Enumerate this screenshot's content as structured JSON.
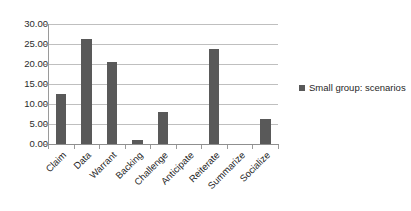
{
  "chart_data": {
    "type": "bar",
    "title": "",
    "xlabel": "",
    "ylabel": "",
    "categories": [
      "Claim",
      "Data",
      "Warrant",
      "Backing",
      "Challenge",
      "Anticipate",
      "Reiterate",
      "Summarize",
      "Socialize"
    ],
    "values": [
      12.5,
      26.3,
      20.5,
      1.0,
      7.9,
      0.0,
      23.8,
      0.0,
      6.3
    ],
    "series": [
      {
        "name": "Small group: scenarios",
        "color": "#595959",
        "values": [
          12.5,
          26.3,
          20.5,
          1.0,
          7.9,
          0.0,
          23.8,
          0.0,
          6.3
        ]
      }
    ],
    "ylim": [
      0,
      30
    ],
    "ytick_step": 5,
    "ytick_labels": [
      "30.00",
      "25.00",
      "20.00",
      "15.00",
      "10.00",
      "5.00",
      "0.00"
    ],
    "ytick_values": [
      30,
      25,
      20,
      15,
      10,
      5,
      0
    ],
    "grid": true,
    "grid_color": "#bfbfbf",
    "legend_position": "right",
    "xlabel_rotation": -45,
    "background": "#ffffff"
  },
  "legend": {
    "entries": [
      {
        "label": "Small group: scenarios",
        "color": "#595959",
        "marker": "square-marker"
      }
    ]
  }
}
